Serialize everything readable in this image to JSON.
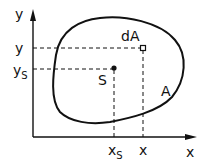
{
  "diagram": {
    "type": "centroid-of-area",
    "colors": {
      "stroke": "#111111",
      "background": "#ffffff"
    },
    "axes": {
      "x_axis_label": "x",
      "y_axis_label": "y"
    },
    "region": {
      "label": "A",
      "description": "closed irregular area"
    },
    "centroid": {
      "label": "S",
      "x_label": "x",
      "x_sub": "S",
      "y_label": "y",
      "y_sub": "S"
    },
    "element": {
      "label": "dA",
      "x_label": "x",
      "y_label": "y"
    }
  }
}
